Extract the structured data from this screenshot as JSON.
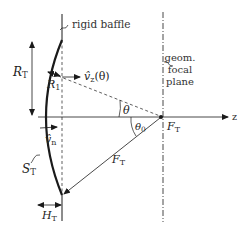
{
  "figure": {
    "type": "geometry-diagram"
  },
  "labels": {
    "baffle": "rigid baffle",
    "focal_plane_line1": "geom.",
    "focal_plane_line2": "focal",
    "focal_plane_line3": "plane",
    "z_axis": "z",
    "R_T_main": "R",
    "R_T_sub": "T",
    "R_1_main": "R",
    "R_1_sub": "1",
    "v_z_main": "v̂",
    "v_z_sub": "z",
    "v_z_arg": "(θ)",
    "theta": "θ",
    "theta0_main": "θ",
    "theta0_sub": "0",
    "F_T_point_main": "F",
    "F_T_point_sub": "T",
    "F_T_length_main": "F",
    "F_T_length_sub": "T",
    "v_n_main": "v̂",
    "v_n_sub": "n",
    "S_T_main": "S",
    "S_T_sub": "T",
    "H_T_main": "H",
    "H_T_sub": "T"
  },
  "colors": {
    "stroke": "#1a1a1a",
    "text": "#222222",
    "background": "#ffffff"
  }
}
